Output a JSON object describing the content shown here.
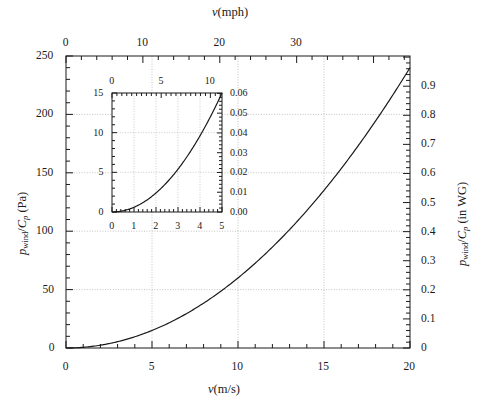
{
  "figure": {
    "name": "wind-pressure-vs-velocity",
    "background": "#ffffff",
    "curve_color": "#1a1a1a",
    "grid_color": "#b4b4b4",
    "axis_color": "#1a1a1a"
  },
  "chart_data": {
    "type": "line",
    "title": "",
    "subtitle": "",
    "equation": "p_wind/C_p = 0.6 v^2",
    "xlabel": "v (m/s)",
    "xlabel_top": "v (mph)",
    "ylabel": "p_wind/C_p (Pa)",
    "ylabel_right": "p_wind/C_p (in WG)",
    "xlim": [
      0,
      20
    ],
    "ylim": [
      0,
      250
    ],
    "xlim_top_mph": [
      0,
      44.74
    ],
    "ylim_right_inwg": [
      0,
      1.0038
    ],
    "grid": true,
    "legend": null,
    "x": [
      0,
      1,
      2,
      3,
      4,
      5,
      6,
      7,
      8,
      9,
      10,
      11,
      12,
      13,
      14,
      15,
      16,
      17,
      18,
      19,
      20
    ],
    "values": [
      0,
      0.6,
      2.4,
      5.4,
      9.6,
      15,
      21.6,
      29.4,
      38.4,
      48.6,
      60,
      72.6,
      86.4,
      101.4,
      117.6,
      135,
      153.6,
      173.4,
      194.4,
      216.6,
      240
    ],
    "xticks": [
      0,
      5,
      10,
      15,
      20
    ],
    "xticklabels": [
      "0",
      "5",
      "10",
      "15",
      "20"
    ],
    "xticks_top": [
      0,
      10,
      20,
      30
    ],
    "xticklabels_top": [
      "0",
      "10",
      "20",
      "30"
    ],
    "yticks": [
      0,
      50,
      100,
      150,
      200,
      250
    ],
    "yticklabels": [
      "0",
      "50",
      "100",
      "150",
      "200",
      "250"
    ],
    "yticks_right": [
      0,
      0.1,
      0.2,
      0.3,
      0.4,
      0.5,
      0.6,
      0.7,
      0.8,
      0.9
    ],
    "yticklabels_right": [
      "0",
      "0.1",
      "0.2",
      "0.3",
      "0.4",
      "0.5",
      "0.6",
      "0.7",
      "0.8",
      "0.9"
    ]
  },
  "inset_chart_data": {
    "type": "line",
    "xlabel": "",
    "ylabel": "",
    "xlim": [
      0,
      5
    ],
    "ylim": [
      0,
      15
    ],
    "xlim_top_mph": [
      0,
      11.18
    ],
    "ylim_right_inwg": [
      0,
      0.0602
    ],
    "grid": true,
    "x": [
      0,
      0.25,
      0.5,
      0.75,
      1,
      1.25,
      1.5,
      1.75,
      2,
      2.25,
      2.5,
      2.75,
      3,
      3.25,
      3.5,
      3.75,
      4,
      4.25,
      4.5,
      4.75,
      5
    ],
    "values": [
      0,
      0.0375,
      0.15,
      0.3375,
      0.6,
      0.9375,
      1.35,
      1.8375,
      2.4,
      3.0375,
      3.75,
      4.5375,
      5.4,
      6.3375,
      7.35,
      8.4375,
      9.6,
      10.8375,
      12.15,
      13.5375,
      15
    ],
    "xticks": [
      0,
      1,
      2,
      3,
      4,
      5
    ],
    "xticklabels": [
      "0",
      "1",
      "2",
      "3",
      "4",
      "5"
    ],
    "xticks_top": [
      0,
      5,
      10
    ],
    "xticklabels_top": [
      "0",
      "5",
      "10"
    ],
    "yticks": [
      0,
      5,
      10,
      15
    ],
    "yticklabels": [
      "0",
      "5",
      "10",
      "15"
    ],
    "yticks_right": [
      0.0,
      0.01,
      0.02,
      0.03,
      0.04,
      0.05,
      0.06
    ],
    "yticklabels_right": [
      "0.00",
      "0.01",
      "0.02",
      "0.03",
      "0.04",
      "0.05",
      "0.06"
    ]
  },
  "labels": {
    "top_axis_title_var": "v",
    "top_axis_title_unit": "(mph)",
    "bottom_axis_title_var": "v",
    "bottom_axis_title_unit": "(m/s)",
    "left_axis_p": "p",
    "left_axis_sub": "wind",
    "left_axis_slash": "/",
    "left_axis_c": "C",
    "left_axis_csub": "p",
    "left_axis_unit": "(Pa)",
    "right_axis_p": "p",
    "right_axis_sub": "wind",
    "right_axis_slash": "/",
    "right_axis_c": "C",
    "right_axis_csub": "p",
    "right_axis_unit": "(in WG)"
  }
}
